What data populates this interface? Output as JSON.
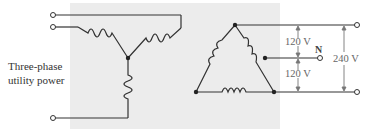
{
  "labels": {
    "source": [
      "Three-phase",
      "utility power"
    ],
    "v_top": "120 V",
    "v_bottom": "120 V",
    "v_total": "240 V",
    "neutral": "N"
  },
  "colors": {
    "line": "#333333",
    "arrow": "#777777",
    "panel": "#ececec"
  }
}
